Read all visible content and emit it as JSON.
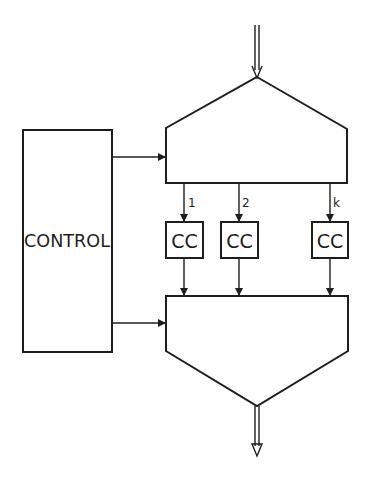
{
  "diagram": {
    "control": {
      "label": "CONTROL"
    },
    "channels": [
      {
        "index_label": "1",
        "unit_label": "CC"
      },
      {
        "index_label": "2",
        "unit_label": "CC"
      },
      {
        "index_label": "k",
        "unit_label": "CC"
      }
    ],
    "top_block": {
      "type": "distributor",
      "shape": "pentagon-up"
    },
    "bottom_block": {
      "type": "collector",
      "shape": "pentagon-down"
    },
    "colors": {
      "line": "#1e1e1e",
      "background": "#ffffff"
    }
  }
}
